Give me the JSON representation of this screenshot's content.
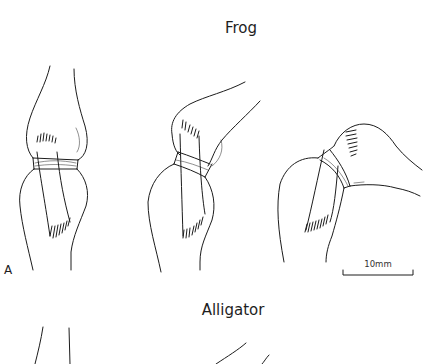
{
  "figure": {
    "panel_label": "A",
    "sections": [
      {
        "title": "Frog",
        "views": [
          {
            "name": "knee-extended"
          },
          {
            "name": "knee-partially-flexed"
          },
          {
            "name": "knee-flexed"
          }
        ]
      },
      {
        "title": "Alligator",
        "views": [
          {
            "name": "knee-extended-partial"
          },
          {
            "name": "knee-partially-flexed-partial"
          }
        ]
      }
    ],
    "scale_bar": {
      "label": "10mm",
      "length_mm": 10
    },
    "colors": {
      "line": "#1c1c1c",
      "background": "#ffffff"
    }
  }
}
